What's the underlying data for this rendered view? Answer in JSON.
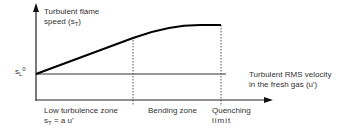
{
  "diagram": {
    "y_axis_label_line1": "Turbulent flame",
    "y_axis_label_line2_prefix": "speed (s",
    "y_axis_label_sub": "T",
    "y_axis_label_suffix": ")",
    "sl0_label_base": "s",
    "sl0_label_sub": "L",
    "sl0_label_sup": "0",
    "x_axis_label_line1": "Turbulent RMS velocity",
    "x_axis_label_line2": "in the fresh gas (u')",
    "zones": [
      {
        "name": "Low turbulence zone",
        "formula_base": "s",
        "formula_sub": "T",
        "formula_rest": " = a u'"
      },
      {
        "name": "Bending zone"
      },
      {
        "name": "Quenching",
        "name_line2": "limit"
      }
    ],
    "colors": {
      "curve": "#000000",
      "axis": "#222222",
      "dotted": "#555555"
    }
  }
}
